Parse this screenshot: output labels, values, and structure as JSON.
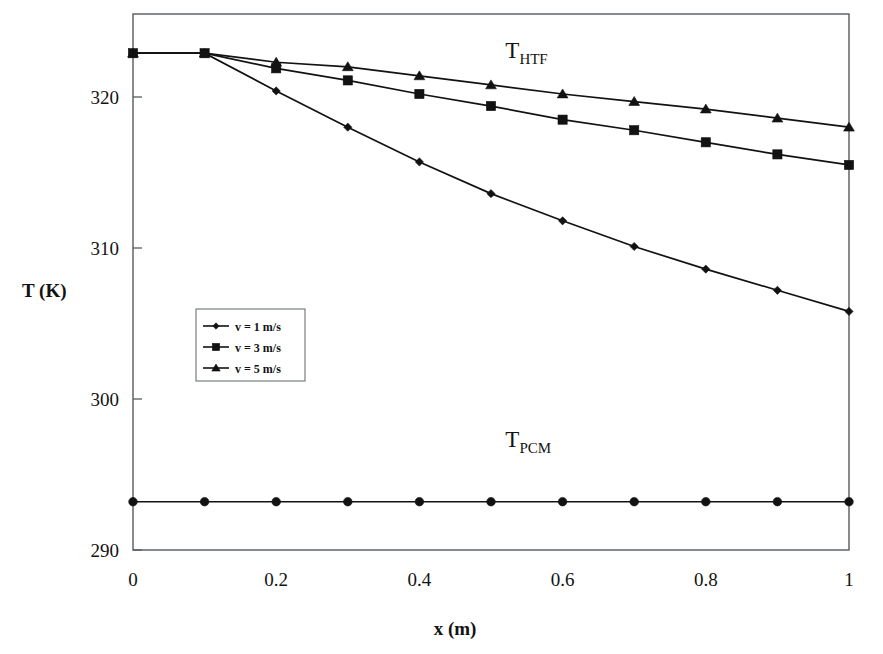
{
  "chart_data": {
    "type": "line",
    "title": "",
    "xlabel": "x (m)",
    "ylabel": "T (K)",
    "xlim": [
      0,
      1
    ],
    "ylim": [
      290,
      324
    ],
    "xticks": [
      "0",
      "0.2",
      "0.4",
      "0.6",
      "0.8",
      "1"
    ],
    "xtick_values": [
      0,
      0.2,
      0.4,
      0.6,
      0.8,
      1
    ],
    "yticks": [
      "290",
      "300",
      "310",
      "320"
    ],
    "ytick_values": [
      290,
      300,
      310,
      320
    ],
    "grid": false,
    "legend_position": "inner-left",
    "x": [
      0,
      0.1,
      0.2,
      0.3,
      0.4,
      0.5,
      0.6,
      0.7,
      0.8,
      0.9,
      1.0
    ],
    "series": [
      {
        "name": "v = 1 m/s",
        "marker": "diamond",
        "values": [
          322.9,
          322.9,
          320.4,
          318.0,
          315.7,
          313.6,
          311.8,
          310.1,
          308.6,
          307.2,
          305.8
        ]
      },
      {
        "name": "v = 3 m/s",
        "marker": "square",
        "values": [
          322.9,
          322.9,
          321.9,
          321.1,
          320.2,
          319.4,
          318.5,
          317.8,
          317.0,
          316.2,
          315.5
        ]
      },
      {
        "name": "v = 5 m/s",
        "marker": "triangle",
        "values": [
          322.9,
          322.9,
          322.3,
          322.0,
          321.4,
          320.8,
          320.2,
          319.7,
          319.2,
          318.6,
          318.0
        ]
      },
      {
        "name": "T_PCM",
        "marker": "circle",
        "values": [
          293.2,
          293.2,
          293.2,
          293.2,
          293.2,
          293.2,
          293.2,
          293.2,
          293.2,
          293.2,
          293.2
        ]
      }
    ],
    "annotations": [
      {
        "id": "htf",
        "base": "T",
        "sub": "HTF",
        "x": 0.52,
        "y": 322.6
      },
      {
        "id": "pcm",
        "base": "T",
        "sub": "PCM",
        "x": 0.52,
        "y": 296.8
      }
    ],
    "colors": {
      "line": "#121212",
      "marker": "#121212",
      "frame": "#555b5e",
      "background": "#ffffff"
    }
  },
  "legend": {
    "entries": [
      {
        "label": "v = 1 m/s",
        "marker": "diamond"
      },
      {
        "label": "v = 3 m/s",
        "marker": "square"
      },
      {
        "label": "v = 5 m/s",
        "marker": "triangle"
      }
    ]
  },
  "labels": {
    "y_axis": "T (K)",
    "x_axis": "x (m)"
  }
}
